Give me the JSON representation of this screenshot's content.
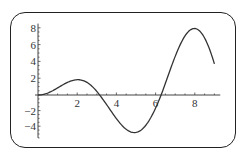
{
  "chart_data": {
    "type": "line",
    "title": "",
    "xlabel": "",
    "ylabel": "",
    "function": "x*sin(x)",
    "x_range": [
      0,
      9
    ],
    "xlim": [
      0,
      9.3
    ],
    "ylim": [
      -5.5,
      8.5
    ],
    "x_ticks": [
      2,
      4,
      6,
      8
    ],
    "x_tick_labels": [
      "2",
      "4",
      "6",
      "8"
    ],
    "y_ticks": [
      -4,
      -2,
      2,
      4,
      6,
      8
    ],
    "y_tick_labels": [
      "-4",
      "-2",
      "2",
      "4",
      "6",
      "8"
    ],
    "grid": false,
    "legend": null,
    "series": [
      {
        "name": "f(x)",
        "x": [
          0,
          0.5,
          1,
          1.5,
          2,
          2.5,
          3,
          3.5,
          4,
          4.5,
          5,
          5.5,
          6,
          6.5,
          7,
          7.5,
          8,
          8.5,
          9
        ],
        "values": [
          0,
          0.24,
          0.84,
          1.5,
          1.82,
          1.5,
          0.42,
          -1.23,
          -3.03,
          -4.4,
          -4.79,
          -3.89,
          -1.68,
          1.4,
          4.6,
          7.04,
          7.91,
          6.8,
          3.71
        ]
      }
    ],
    "colors": {
      "line": "#333333",
      "axis": "#444444",
      "frame": "#222222"
    }
  }
}
